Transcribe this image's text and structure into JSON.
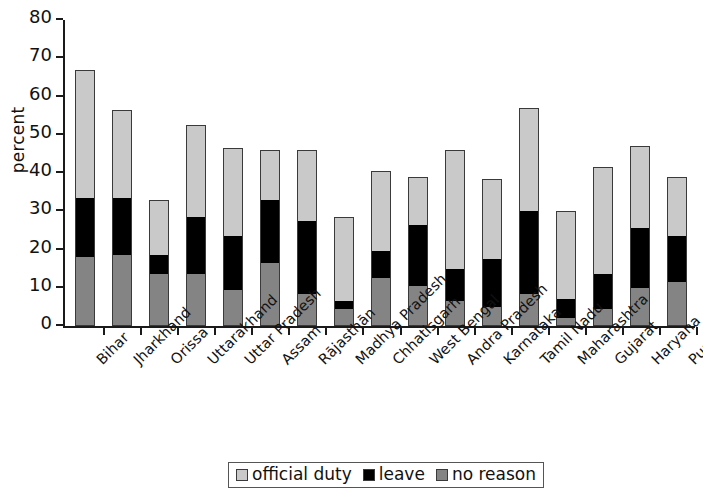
{
  "chart_data": {
    "type": "bar",
    "subtype": "stacked-vertical",
    "title": "",
    "xlabel": "",
    "ylabel": "percent",
    "ylim": [
      0,
      80
    ],
    "yticks": [
      0,
      10,
      20,
      30,
      40,
      50,
      60,
      70,
      80
    ],
    "grid": false,
    "legend_position": "bottom-center",
    "stack_order_bottom_to_top": [
      "no reason",
      "leave",
      "official duty"
    ],
    "categories": [
      "Bihar",
      "Jharkhand",
      "Orissa",
      "Uttarakhand",
      "Uttar Pradesh",
      "Assam",
      "Rājasthān",
      "Madhya Pradesh",
      "Chhatisgarh",
      "West Bengal",
      "Andra Pradesh",
      "Karnataka",
      "Tamil Nadu",
      "Maharashtra",
      "Gujarat",
      "Haryana",
      "Punjab"
    ],
    "series": [
      {
        "name": "no reason",
        "color": "#848484",
        "values": [
          18.0,
          18.5,
          13.5,
          13.5,
          9.5,
          16.5,
          8.5,
          4.5,
          12.5,
          10.5,
          6.5,
          5.0,
          8.5,
          2.0,
          4.5,
          10.0,
          11.5
        ]
      },
      {
        "name": "leave",
        "color": "#000000",
        "values": [
          15.5,
          15.0,
          5.0,
          15.0,
          14.0,
          16.5,
          19.0,
          2.0,
          7.0,
          16.0,
          8.5,
          12.5,
          21.5,
          5.0,
          9.0,
          15.5,
          12.0
        ]
      },
      {
        "name": "official duty",
        "color": "#c9c9c9",
        "values": [
          33.5,
          23.0,
          14.5,
          24.0,
          23.0,
          13.0,
          18.5,
          22.0,
          21.0,
          12.5,
          31.0,
          21.0,
          27.0,
          23.0,
          28.0,
          21.5,
          15.5
        ]
      }
    ],
    "totals": [
      67.0,
      56.5,
      33.0,
      52.5,
      46.5,
      46.0,
      46.0,
      28.5,
      40.5,
      39.0,
      46.0,
      38.5,
      57.0,
      30.0,
      41.5,
      47.0,
      39.0
    ]
  },
  "legend": {
    "entries": [
      {
        "label": "official duty",
        "swatch": "swatch-official"
      },
      {
        "label": "leave",
        "swatch": "swatch-leave"
      },
      {
        "label": "no reason",
        "swatch": "swatch-noreason"
      }
    ]
  }
}
